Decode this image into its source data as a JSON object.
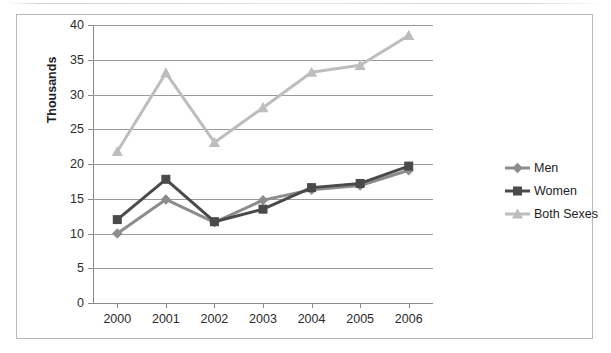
{
  "chart_data": {
    "type": "line",
    "title": "",
    "xlabel": "",
    "ylabel": "Thousands",
    "categories": [
      "2000",
      "2001",
      "2002",
      "2003",
      "2004",
      "2005",
      "2006"
    ],
    "ylim": [
      0,
      40
    ],
    "ytick_step": 5,
    "yticks": [
      "0",
      "5",
      "10",
      "15",
      "20",
      "25",
      "30",
      "35",
      "40"
    ],
    "grid": "horizontal",
    "legend_position": "right",
    "series": [
      {
        "name": "Men",
        "color": "#8c8c8c",
        "marker": "diamond",
        "values": [
          10.0,
          14.9,
          11.6,
          14.8,
          16.3,
          16.9,
          19.1
        ]
      },
      {
        "name": "Women",
        "color": "#4a4a4a",
        "marker": "square",
        "values": [
          12.0,
          17.8,
          11.7,
          13.5,
          16.6,
          17.2,
          19.7
        ]
      },
      {
        "name": "Both Sexes",
        "color": "#bdbdbd",
        "marker": "triangle",
        "values": [
          21.8,
          33.1,
          23.1,
          28.1,
          33.2,
          34.2,
          38.5
        ]
      }
    ]
  },
  "legend": {
    "items": [
      {
        "label": "Men"
      },
      {
        "label": "Women"
      },
      {
        "label": "Both Sexes"
      }
    ]
  },
  "axis": {
    "y_title": "Thousands"
  },
  "colors": {
    "men": "#8c8c8c",
    "women": "#4a4a4a",
    "both_sexes": "#bdbdbd",
    "gridline": "#9a9a9a",
    "frame": "#b9b9b9",
    "text": "#1d1d1d"
  }
}
